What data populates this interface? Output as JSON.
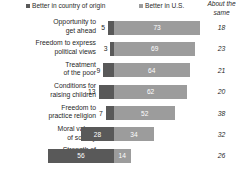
{
  "legend": {
    "entries": [
      {
        "label": "Better in country of origin",
        "color": "#595959",
        "icon": "square-swatch-icon"
      },
      {
        "label": "Better in U.S.",
        "color": "#9c9c9c",
        "icon": "square-swatch-icon"
      }
    ],
    "about_same_header_line1": "About the",
    "about_same_header_line2": "same"
  },
  "chart_data": {
    "type": "bar",
    "title": "",
    "subtitle": "",
    "xlabel": "",
    "ylabel": "",
    "orientation": "horizontal",
    "stacked": true,
    "grid": false,
    "legend_position": "top",
    "categories": [
      "Opportunity to get ahead",
      "Freedom to express political views",
      "Treatment of the poor",
      "Conditions for raising children",
      "Freedom to practice religion",
      "Moral values of society",
      "Strength of family ties"
    ],
    "category_lines": [
      [
        "Opportunity to",
        "get ahead"
      ],
      [
        "Freedom to express",
        "political views"
      ],
      [
        "Treatment",
        "of the poor"
      ],
      [
        "Conditions for",
        "raising children"
      ],
      [
        "Freedom to",
        "practice religion"
      ],
      [
        "Moral values",
        "of society"
      ],
      [
        "Strength of",
        "family ties"
      ]
    ],
    "series": [
      {
        "name": "Better in country of origin",
        "color": "#595959",
        "values": [
          5,
          3,
          9,
          13,
          7,
          28,
          56
        ]
      },
      {
        "name": "Better in U.S.",
        "color": "#9c9c9c",
        "values": [
          73,
          69,
          64,
          62,
          52,
          34,
          14
        ]
      },
      {
        "name": "About the same",
        "color": "#ffffff",
        "values": [
          18,
          23,
          21,
          20,
          38,
          32,
          26
        ]
      }
    ],
    "rows": [
      {
        "label_line1": "Opportunity to",
        "label_line2": "get ahead",
        "origin": 5,
        "us": 73,
        "same": 18,
        "origin_label_inside": false
      },
      {
        "label_line1": "Freedom to express",
        "label_line2": "political views",
        "origin": 3,
        "us": 69,
        "same": 23,
        "origin_label_inside": false
      },
      {
        "label_line1": "Treatment",
        "label_line2": "of the poor",
        "origin": 9,
        "us": 64,
        "same": 21,
        "origin_label_inside": false
      },
      {
        "label_line1": "Conditions for",
        "label_line2": "raising children",
        "origin": 13,
        "us": 62,
        "same": 20,
        "origin_label_inside": false
      },
      {
        "label_line1": "Freedom to",
        "label_line2": "practice religion",
        "origin": 7,
        "us": 52,
        "same": 38,
        "origin_label_inside": false
      },
      {
        "label_line1": "Moral values",
        "label_line2": "of society",
        "origin": 28,
        "us": 34,
        "same": 32,
        "origin_label_inside": true
      },
      {
        "label_line1": "Strength of",
        "label_line2": "family ties",
        "origin": 56,
        "us": 14,
        "same": 26,
        "origin_label_inside": true
      }
    ]
  },
  "colors": {
    "series_origin": "#595959",
    "series_us": "#9c9c9c",
    "text": "#1f1f1f",
    "background": "#ffffff"
  }
}
